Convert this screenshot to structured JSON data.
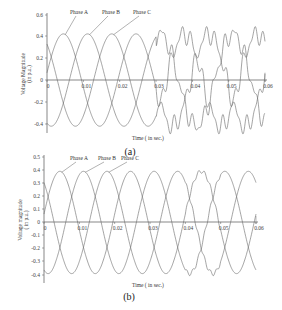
{
  "chart_data": [
    {
      "id": "a",
      "type": "line",
      "subtitle": "(a)",
      "xlabel": "Time ( in sec.)",
      "ylabel": "Voltage Magnitude (in p.u.)",
      "xlim": [
        0,
        0.06
      ],
      "ylim": [
        -0.5,
        0.6
      ],
      "xticks": [
        "0",
        "0.01",
        "0.02",
        "0.03",
        "0.04",
        "0.05",
        "0.06"
      ],
      "yticks": [
        "0.6",
        "0.4",
        "0.2",
        "0",
        "-0.2",
        "-0.4"
      ],
      "grid": false,
      "frequency_hz": 50,
      "amplitude": 0.42,
      "distortion_start": 0.03,
      "series": [
        {
          "name": "Phase A",
          "phase_deg": 0
        },
        {
          "name": "Phase B",
          "phase_deg": -120
        },
        {
          "name": "Phase C",
          "phase_deg": 120
        }
      ],
      "annotations": [
        "Phase A",
        "Phase B",
        "Phase C"
      ]
    },
    {
      "id": "b",
      "type": "line",
      "subtitle": "(b)",
      "xlabel": "Time ( in sec.)",
      "ylabel": "Voltage magnitude ( in p.u.)",
      "xlim": [
        0,
        0.06
      ],
      "ylim": [
        -0.45,
        0.5
      ],
      "xticks": [
        "0",
        "0.01",
        "0.02",
        "0.03",
        "0.04",
        "0.05",
        "0.06"
      ],
      "yticks": [
        "0.5",
        "0.4",
        "0.3",
        "0.2",
        "0.1",
        "0",
        "-0.1",
        "-0.2",
        "-0.3",
        "-0.4"
      ],
      "grid": false,
      "frequency_hz": 50,
      "amplitude": 0.39,
      "series": [
        {
          "name": "Phase A",
          "phase_deg": 0
        },
        {
          "name": "Phase B",
          "phase_deg": -120
        },
        {
          "name": "Phase C",
          "phase_deg": 120
        }
      ],
      "annotations": [
        "Phase A",
        "Phase B",
        "Phase C"
      ]
    }
  ]
}
